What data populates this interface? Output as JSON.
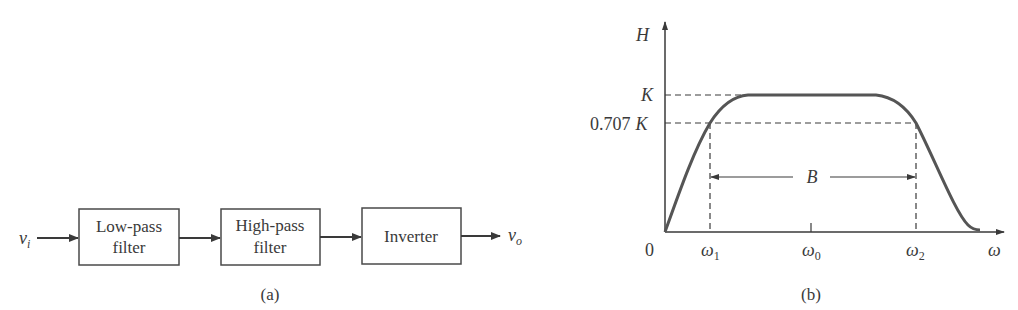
{
  "panel_a": {
    "caption": "(a)",
    "input_label": "v",
    "input_sub": "i",
    "output_label": "v",
    "output_sub": "o",
    "blocks": [
      {
        "line1": "Low-pass",
        "line2": "filter"
      },
      {
        "line1": "High-pass",
        "line2": "filter"
      },
      {
        "line1": "Inverter",
        "line2": ""
      }
    ]
  },
  "panel_b": {
    "caption": "(b)",
    "y_axis_label": "H",
    "x_axis_label": "ω",
    "origin_label": "0",
    "y_ticks": {
      "k": "K",
      "k707_num": "0.707",
      "k707_sym": "K"
    },
    "x_ticks": [
      {
        "base": "ω",
        "sub": "1"
      },
      {
        "base": "ω",
        "sub": "0"
      },
      {
        "base": "ω",
        "sub": "2"
      }
    ],
    "bandwidth_label": "B"
  },
  "colors": {
    "ink": "#3a3a3a",
    "curve": "#555555"
  }
}
